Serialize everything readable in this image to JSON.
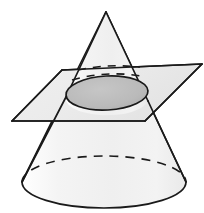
{
  "figure": {
    "title": "Cone intersected by a plane forming an elliptical cross-section",
    "background_color": "#ffffff",
    "width": 204,
    "height": 213,
    "stroke_color": "#1a1a1a",
    "labels": {
      "cone": "cone",
      "plane": "cutting-plane",
      "cross_section": "elliptical-cross-section",
      "base": "cone-base",
      "apex": "cone-apex"
    }
  },
  "chart_data": {
    "type": "diagram",
    "title": "Cone intersected by a plane forming an elliptical cross-section",
    "shapes": [
      {
        "name": "cone",
        "kind": "cone",
        "apex": [
          106,
          12
        ],
        "base_center": [
          104,
          182
        ],
        "base_rx": 82,
        "base_ry": 26,
        "fill": "#f2f2f2",
        "stroke": "#1a1a1a",
        "stroke_width": 1.6
      },
      {
        "name": "cone-base-back-arc",
        "kind": "dashed-arc",
        "from": [
          22,
          182
        ],
        "to": [
          186,
          182
        ],
        "rx": 82,
        "ry": 26,
        "sweep": "up",
        "top_y": 156,
        "dash": "9,7",
        "stroke": "#1a1a1a"
      },
      {
        "name": "cutting-plane",
        "kind": "parallelogram",
        "points": [
          [
            12,
            121
          ],
          [
            62,
            70
          ],
          [
            202,
            64
          ],
          [
            145,
            121
          ]
        ],
        "fill": "#ececec",
        "stroke": "#1a1a1a",
        "stroke_width": 1.6
      },
      {
        "name": "elliptical-cross-section",
        "kind": "ellipse",
        "center": [
          107,
          93
        ],
        "rx": 41,
        "ry": 17,
        "rotation_deg": -3,
        "fill": "#b8b8b8",
        "stroke": "#1a1a1a",
        "stroke_width": 1.6
      },
      {
        "name": "cross-section-upper-hidden-arc",
        "kind": "dashed-arc",
        "from": [
          78,
          70
        ],
        "to": [
          140,
          67
        ],
        "top_y": 66,
        "dash": "8,7",
        "stroke": "#1a1a1a"
      },
      {
        "name": "cross-section-lower-hidden-arc",
        "kind": "dashed-arc",
        "from": [
          72,
          80
        ],
        "to": [
          146,
          77
        ],
        "top_y": 74,
        "dash": "8,7",
        "stroke": "#1a1a1a"
      }
    ],
    "colors": {
      "background": "#ffffff",
      "cone_fill": "#f2f2f2",
      "plane_fill": "#ececec",
      "ellipse_fill": "#b8b8b8",
      "outline": "#1a1a1a"
    },
    "annotations": [],
    "legend": [],
    "grid": false
  }
}
